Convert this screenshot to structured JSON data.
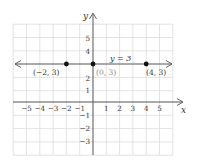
{
  "graph": {
    "axes": {
      "x_label": "x",
      "y_label": "y",
      "x_ticks": [
        "−5",
        "−4",
        "−3",
        "−2",
        "−1",
        "1",
        "2",
        "3",
        "4",
        "5"
      ],
      "y_ticks_pos": [
        "1",
        "2",
        "4",
        "5"
      ],
      "y_ticks_neg": [
        "−1",
        "−2",
        "−3"
      ],
      "x_range": [
        -6,
        6
      ],
      "y_range": [
        -4,
        6
      ]
    },
    "line": {
      "equation_label": "y = 3",
      "y_value": 3
    },
    "points": [
      {
        "label": "(−2, 3)",
        "x": -2,
        "y": 3
      },
      {
        "label": "(0, 3)",
        "x": 0,
        "y": 3
      },
      {
        "label": "(4, 3)",
        "x": 4,
        "y": 3
      }
    ],
    "colors": {
      "grid": "#dcdcdc",
      "axis": "#555555",
      "line": "#555555",
      "point": "#111111",
      "label_gray": "#888888"
    }
  }
}
